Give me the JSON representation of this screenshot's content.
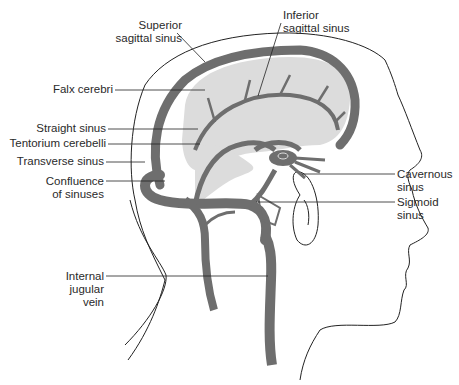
{
  "diagram": {
    "colors": {
      "vessel": "#6e6e6e",
      "brain_fill": "#dcdcdc",
      "outline": "#222222",
      "background": "#ffffff"
    },
    "labels": {
      "superior_sagittal_sinus": [
        "Superior",
        "sagittal sinus"
      ],
      "inferior_sagittal_sinus": [
        "Inferior",
        "sagittal sinus"
      ],
      "falx_cerebri": [
        "Falx cerebri"
      ],
      "straight_sinus": [
        "Straight sinus"
      ],
      "tentorium_cerebelli": [
        "Tentorium cerebelli"
      ],
      "transverse_sinus": [
        "Transverse sinus"
      ],
      "confluence_of_sinuses": [
        "Confluence",
        "of sinuses"
      ],
      "cavernous_sinus": [
        "Cavernous",
        "sinus"
      ],
      "sigmoid_sinus": [
        "Sigmoid",
        "sinus"
      ],
      "internal_jugular_vein": [
        "Internal",
        "jugular",
        "vein"
      ]
    }
  }
}
